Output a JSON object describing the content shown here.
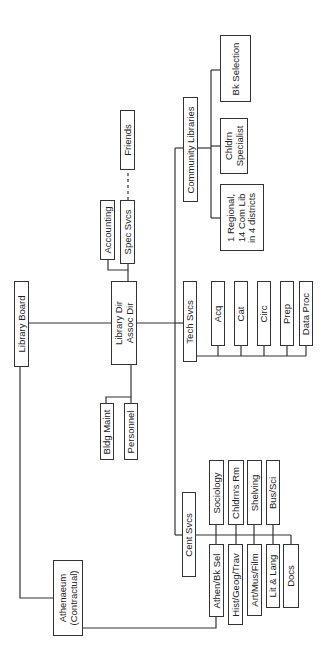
{
  "diagram": {
    "type": "org-chart",
    "orientation": "rotated-90-ccw",
    "nodes": {
      "library_board": "Library Board",
      "library_dir": "Library Dir\nAssoc Dir",
      "accounting": "Accounting",
      "spec_svcs": "Spec Svcs",
      "friends": "Friends",
      "community_libraries": "Community Libraries",
      "bk_selection": "Bk Selection",
      "chldrn_specialist": "Chldrn\nSpecialist",
      "regional": "1 Regional,\n14 Com Lib\nin 4 districts",
      "tech_svcs": "Tech Svcs",
      "acq": "Acq",
      "cat": "Cat",
      "circ": "Circ",
      "prep": "Prep",
      "data_proc": "Data Proc",
      "bldg_maint": "Bldg Maint",
      "personnel": "Personnel",
      "cent_svcs": "Cent Svcs",
      "athenaeum": "Athenaeum\n(Contractual)",
      "sociology": "Sociology",
      "chldrns_rm": "Chldrn's Rm",
      "shelving": "Shelving",
      "bus_sci": "Bus/Sci",
      "athen_bk_sel": "Athen/Bk Sel",
      "hist_geog_trav": "Hist/Geog/Trav",
      "art_mus_film": "Art/Mus/Film",
      "lit_lang": "Lit & Lang",
      "docs": "Docs"
    },
    "edges": [
      [
        "Library Board",
        "Library Dir/Assoc Dir"
      ],
      [
        "Library Board",
        "Athenaeum (Contractual)"
      ],
      [
        "Library Dir/Assoc Dir",
        "Accounting"
      ],
      [
        "Library Dir/Assoc Dir",
        "Spec Svcs"
      ],
      [
        "Spec Svcs",
        "Friends",
        "dashed"
      ],
      [
        "Library Dir/Assoc Dir",
        "Bldg Maint"
      ],
      [
        "Library Dir/Assoc Dir",
        "Personnel"
      ],
      [
        "Library Dir/Assoc Dir",
        "Community Libraries"
      ],
      [
        "Library Dir/Assoc Dir",
        "Tech Svcs"
      ],
      [
        "Library Dir/Assoc Dir",
        "Cent Svcs"
      ],
      [
        "Community Libraries",
        "Bk Selection"
      ],
      [
        "Community Libraries",
        "Chldrn Specialist"
      ],
      [
        "Community Libraries",
        "1 Regional, 14 Com Lib in 4 districts"
      ],
      [
        "Tech Svcs",
        "Acq"
      ],
      [
        "Tech Svcs",
        "Cat"
      ],
      [
        "Tech Svcs",
        "Circ"
      ],
      [
        "Tech Svcs",
        "Prep"
      ],
      [
        "Tech Svcs",
        "Data Proc"
      ],
      [
        "Cent Svcs",
        "Sociology"
      ],
      [
        "Cent Svcs",
        "Chldrn's Rm"
      ],
      [
        "Cent Svcs",
        "Shelving"
      ],
      [
        "Cent Svcs",
        "Bus/Sci"
      ],
      [
        "Cent Svcs",
        "Athen/Bk Sel"
      ],
      [
        "Cent Svcs",
        "Hist/Geog/Trav"
      ],
      [
        "Cent Svcs",
        "Art/Mus/Film"
      ],
      [
        "Cent Svcs",
        "Lit & Lang"
      ],
      [
        "Cent Svcs",
        "Docs"
      ],
      [
        "Athenaeum (Contractual)",
        "Athen/Bk Sel"
      ]
    ]
  }
}
